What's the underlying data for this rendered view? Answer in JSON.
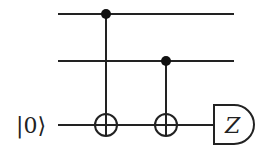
{
  "circuit": {
    "wires": [
      {
        "id": "q1",
        "label": "",
        "y": 14
      },
      {
        "id": "q2",
        "label": "",
        "y": 61
      },
      {
        "id": "ancilla",
        "label": "|0⟩",
        "y": 125
      }
    ],
    "gates": [
      {
        "type": "CNOT",
        "control": "q1",
        "target": "ancilla",
        "x": 106
      },
      {
        "type": "CNOT",
        "control": "q2",
        "target": "ancilla",
        "x": 166
      },
      {
        "type": "measurement",
        "wire": "ancilla",
        "basis": "Z"
      }
    ],
    "ancilla_label": "|0⟩",
    "measurement_label": "Z"
  }
}
